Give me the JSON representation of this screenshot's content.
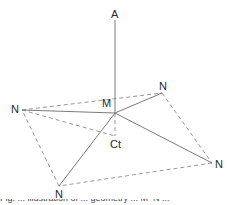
{
  "diagram": {
    "type": "coordination-geometry",
    "colors": {
      "solid_line": "#7a7a7a",
      "dashed_line": "#8a8a8a",
      "label": "#2a2a2a"
    },
    "nodes": {
      "A": {
        "label": "A",
        "x": 115,
        "y": 15
      },
      "M": {
        "label": "M",
        "x": 115,
        "y": 113
      },
      "Ct": {
        "label": "Ct",
        "x": 115,
        "y": 136
      },
      "N1": {
        "label": "N",
        "x": 22,
        "y": 110
      },
      "N2": {
        "label": "N",
        "x": 162,
        "y": 93
      },
      "N3": {
        "label": "N",
        "x": 212,
        "y": 163
      },
      "N4": {
        "label": "N",
        "x": 59,
        "y": 186
      }
    },
    "solid_edges": [
      [
        "A",
        "M"
      ],
      [
        "M",
        "N1"
      ],
      [
        "M",
        "N2"
      ],
      [
        "M",
        "N3"
      ],
      [
        "M",
        "N4"
      ]
    ],
    "dashed_edges": [
      [
        "N1",
        "N2"
      ],
      [
        "N2",
        "N3"
      ],
      [
        "N3",
        "N4"
      ],
      [
        "N4",
        "N1"
      ],
      [
        "M",
        "Ct"
      ],
      [
        "N1",
        "Ct"
      ]
    ]
  },
  "labels": {
    "A": "A",
    "M": "M",
    "Ct": "Ct",
    "N_left": "N",
    "N_top_right": "N",
    "N_right": "N",
    "N_bottom": "N"
  },
  "caption": "Fig. ... illustration of ... geometry ... M–N ..."
}
